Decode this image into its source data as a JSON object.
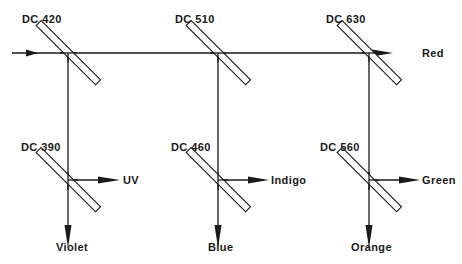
{
  "diagram": {
    "type": "dichroic-mirror-beam-splitting-diagram",
    "colors": {
      "line": "#1a1a1a",
      "background": "#ffffff"
    },
    "input_beam": {
      "direction": "left-to-right"
    },
    "mirrors": [
      {
        "id": "m1",
        "label": "DC 420",
        "position": "top"
      },
      {
        "id": "m2",
        "label": "DC 510",
        "position": "top"
      },
      {
        "id": "m3",
        "label": "DC 630",
        "position": "top"
      },
      {
        "id": "m4",
        "label": "DC 390",
        "position": "bottom"
      },
      {
        "id": "m5",
        "label": "DC 460",
        "position": "bottom"
      },
      {
        "id": "m6",
        "label": "DC 560",
        "position": "bottom"
      }
    ],
    "outputs": [
      {
        "label": "Red",
        "from": "DC 630",
        "direction": "right"
      },
      {
        "label": "UV",
        "from": "DC 390",
        "direction": "right"
      },
      {
        "label": "Violet",
        "from": "DC 390",
        "direction": "down"
      },
      {
        "label": "Indigo",
        "from": "DC 460",
        "direction": "right"
      },
      {
        "label": "Blue",
        "from": "DC 460",
        "direction": "down"
      },
      {
        "label": "Green",
        "from": "DC 560",
        "direction": "right"
      },
      {
        "label": "Orange",
        "from": "DC 560",
        "direction": "down"
      }
    ]
  }
}
